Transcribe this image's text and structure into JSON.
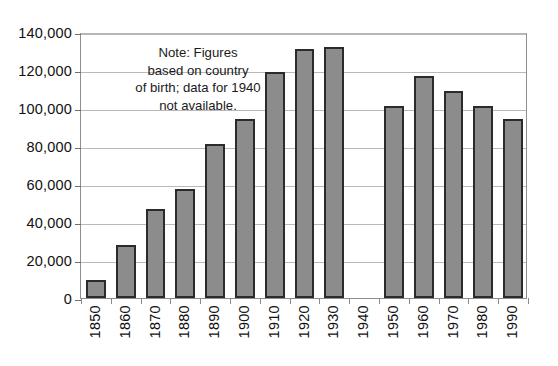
{
  "chart_data": {
    "type": "bar",
    "title": "",
    "subtitle": "",
    "xlabel": "",
    "ylabel": "",
    "categories": [
      "1850",
      "1860",
      "1870",
      "1880",
      "1890",
      "1900",
      "1910",
      "1920",
      "1930",
      "1940",
      "1950",
      "1960",
      "1970",
      "1980",
      "1990"
    ],
    "values": [
      9700,
      28000,
      47000,
      57500,
      81000,
      94000,
      119000,
      131000,
      132000,
      null,
      101000,
      117000,
      109000,
      101000,
      94000
    ],
    "series": [
      {
        "name": "Foreign-born population",
        "values": [
          9700,
          28000,
          47000,
          57500,
          81000,
          94000,
          119000,
          131000,
          132000,
          null,
          101000,
          117000,
          109000,
          101000,
          94000
        ]
      }
    ],
    "ylim": [
      0,
      140000
    ],
    "yticks": [
      0,
      20000,
      40000,
      60000,
      80000,
      100000,
      120000,
      140000
    ],
    "ytick_labels": [
      "0",
      "20,000",
      "40,000",
      "60,000",
      "80,000",
      "100,000",
      "120,000",
      "140,000"
    ],
    "grid": true,
    "legend": "none",
    "missing_categories": [
      "1940"
    ],
    "annotations": [
      {
        "name": "note",
        "text": "Note: Figures based on country of birth; data for 1940 not available.",
        "lines": [
          "Note: Figures",
          "based on country",
          "of birth; data for 1940",
          "not available."
        ]
      }
    ],
    "colors": {
      "bar_fill": "#8c8c8c",
      "bar_border": "#2b2b2b",
      "gridline": "#b9b9b9",
      "axis": "#8e8e8e",
      "text": "#111111",
      "background": "#ffffff"
    }
  }
}
